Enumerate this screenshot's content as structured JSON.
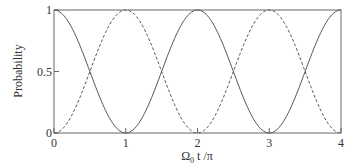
{
  "chart_data": {
    "type": "line",
    "title": "",
    "xlabel": "Ω₀ t /π",
    "ylabel": "Probability",
    "xlim": [
      0,
      4
    ],
    "ylim": [
      0,
      1
    ],
    "xticks": [
      "0",
      "1",
      "2",
      "3",
      "4"
    ],
    "yticks": [
      "0",
      "0.5",
      "1"
    ],
    "grid": false,
    "legend": null,
    "series": [
      {
        "name": "solid",
        "style": "solid",
        "formula": "cos^2(pi*x/2)",
        "x": [
          0,
          0.5,
          1,
          1.5,
          2,
          2.5,
          3,
          3.5,
          4
        ],
        "values": [
          1,
          0.5,
          0,
          0.5,
          1,
          0.5,
          0,
          0.5,
          1
        ]
      },
      {
        "name": "dashed",
        "style": "dashed",
        "formula": "sin^2(pi*x/2)",
        "x": [
          0,
          0.5,
          1,
          1.5,
          2,
          2.5,
          3,
          3.5,
          4
        ],
        "values": [
          0,
          0.5,
          1,
          0.5,
          0,
          0.5,
          1,
          0.5,
          0
        ]
      }
    ]
  },
  "axes": {
    "xlabel_main": "Ω",
    "xlabel_sub": "0",
    "xlabel_rest": " t /π",
    "ylabel": "Probability",
    "xticks": [
      "0",
      "1",
      "2",
      "3",
      "4"
    ],
    "yticks": [
      "0",
      "0.5",
      "1"
    ]
  },
  "style": {
    "line_color": "#555555",
    "frame_color": "#666666"
  }
}
